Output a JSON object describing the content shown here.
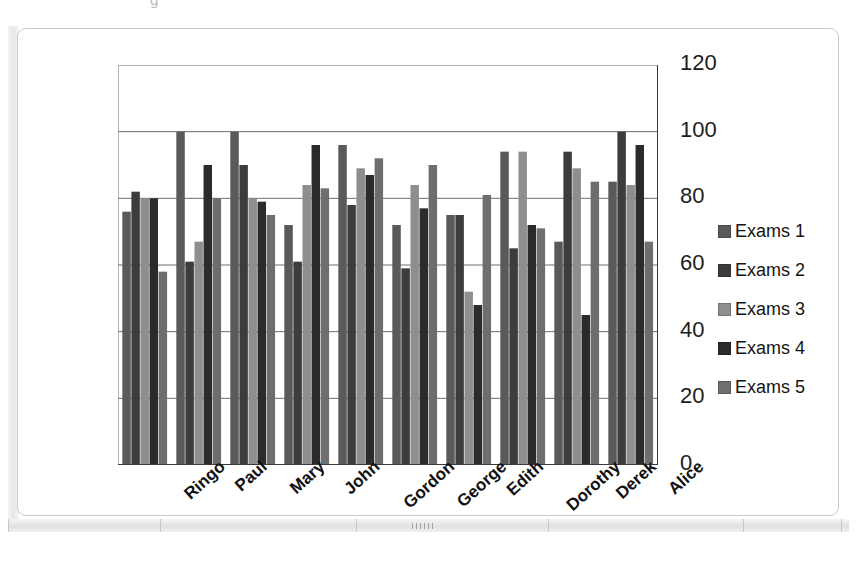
{
  "ghost_text": "g",
  "chart": {
    "background_color": "#ffffff",
    "border_color": "#c9c9c9",
    "axis_color": "#3b3b3b",
    "gridline_color": "#6f6f6f"
  },
  "legend": {
    "position": "right",
    "items": [
      {
        "label": "Exams 1",
        "color": "#5a5a5a",
        "swatch_name": "legend-swatch-exams-1"
      },
      {
        "label": "Exams 2",
        "color": "#3c3c3c",
        "swatch_name": "legend-swatch-exams-2"
      },
      {
        "label": "Exams 3",
        "color": "#8e8e8e",
        "swatch_name": "legend-swatch-exams-3"
      },
      {
        "label": "Exams 4",
        "color": "#2b2b2b",
        "swatch_name": "legend-swatch-exams-4"
      },
      {
        "label": "Exams 5",
        "color": "#6e6e6e",
        "swatch_name": "legend-swatch-exams-5"
      }
    ]
  },
  "yaxis": {
    "ticks": [
      "0",
      "20",
      "40",
      "60",
      "80",
      "100",
      "120"
    ],
    "min": 0,
    "max": 120,
    "step": 20
  },
  "chart_data": {
    "type": "bar",
    "title": "",
    "subtitle": "",
    "xlabel": "",
    "ylabel": "",
    "ylim": [
      0,
      120
    ],
    "ytick_step": 20,
    "grid": true,
    "legend_position": "right",
    "categories": [
      "Ringo",
      "Paul",
      "Mary",
      "John",
      "Gordon",
      "George",
      "Edith",
      "Dorothy",
      "Derek",
      "Alice"
    ],
    "series": [
      {
        "name": "Exams 1",
        "color": "#5a5a5a",
        "values": [
          76,
          100,
          100,
          72,
          96,
          72,
          75,
          94,
          67,
          85
        ]
      },
      {
        "name": "Exams 2",
        "color": "#3c3c3c",
        "values": [
          82,
          61,
          90,
          61,
          78,
          59,
          75,
          65,
          94,
          100
        ]
      },
      {
        "name": "Exams 3",
        "color": "#8e8e8e",
        "values": [
          80,
          67,
          80,
          84,
          89,
          84,
          52,
          94,
          89,
          84
        ]
      },
      {
        "name": "Exams 4",
        "color": "#2b2b2b",
        "values": [
          80,
          90,
          79,
          96,
          87,
          77,
          48,
          72,
          45,
          96
        ]
      },
      {
        "name": "Exams 5",
        "color": "#6e6e6e",
        "values": [
          58,
          80,
          75,
          83,
          92,
          90,
          81,
          71,
          85,
          67
        ]
      }
    ]
  }
}
